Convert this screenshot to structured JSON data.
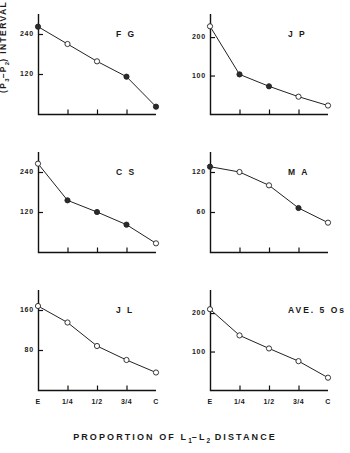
{
  "figure": {
    "ylabel_text": "INTERVAL  (MSEC)",
    "ylabel_prefix": "(P",
    "ylabel_sub1": "3",
    "ylabel_mid": "–P",
    "ylabel_sub2": "2",
    "ylabel_suffix": ")",
    "xlabel_pre": "PROPORTION   OF   L",
    "xlabel_sub1": "1",
    "xlabel_mid": "–L",
    "xlabel_sub2": "2",
    "xlabel_post": "   DISTANCE"
  },
  "chart_data": [
    {
      "type": "line",
      "title": "F G",
      "xlabel": "PROPORTION OF L1-L2 DISTANCE",
      "ylabel": "(P3-P2) INTERVAL (MSEC)",
      "categories": [
        "E",
        "1/4",
        "1/2",
        "3/4",
        "C"
      ],
      "yticks": [
        240,
        120
      ],
      "ylim": [
        0,
        300
      ],
      "values": [
        262,
        210,
        158,
        112,
        22
      ],
      "markers": [
        "filled",
        "open",
        "open",
        "filled",
        "filled"
      ],
      "grid": false,
      "legend": "none"
    },
    {
      "type": "line",
      "title": "J P",
      "xlabel": "PROPORTION OF L1-L2 DISTANCE",
      "ylabel": "(P3-P2) INTERVAL (MSEC)",
      "categories": [
        "E",
        "1/4",
        "1/2",
        "3/4",
        "C"
      ],
      "yticks": [
        200,
        100
      ],
      "ylim": [
        0,
        260
      ],
      "values": [
        228,
        103,
        72,
        45,
        22
      ],
      "markers": [
        "open",
        "filled",
        "filled",
        "open",
        "open"
      ],
      "grid": false,
      "legend": "none"
    },
    {
      "type": "line",
      "title": "C S",
      "xlabel": "PROPORTION OF L1-L2 DISTANCE",
      "ylabel": "(P3-P2) INTERVAL (MSEC)",
      "categories": [
        "E",
        "1/4",
        "1/2",
        "3/4",
        "C"
      ],
      "yticks": [
        240,
        120
      ],
      "ylim": [
        0,
        300
      ],
      "values": [
        265,
        155,
        120,
        82,
        26
      ],
      "markers": [
        "open",
        "filled",
        "filled",
        "filled",
        "open"
      ],
      "grid": false,
      "legend": "none"
    },
    {
      "type": "line",
      "title": "M A",
      "xlabel": "PROPORTION OF L1-L2 DISTANCE",
      "ylabel": "(P3-P2) INTERVAL (MSEC)",
      "categories": [
        "E",
        "1/4",
        "1/2",
        "3/4",
        "C"
      ],
      "yticks": [
        120,
        60
      ],
      "ylim": [
        0,
        150
      ],
      "values": [
        128,
        120,
        100,
        66,
        44
      ],
      "markers": [
        "filled",
        "open",
        "open",
        "filled",
        "open"
      ],
      "grid": false,
      "legend": "none"
    },
    {
      "type": "line",
      "title": "J L",
      "xlabel": "PROPORTION OF L1-L2 DISTANCE",
      "ylabel": "(P3-P2) INTERVAL (MSEC)",
      "categories": [
        "E",
        "1/4",
        "1/2",
        "3/4",
        "C"
      ],
      "yticks": [
        160,
        80
      ],
      "ylim": [
        0,
        200
      ],
      "values": [
        168,
        135,
        88,
        60,
        35
      ],
      "markers": [
        "open",
        "open",
        "open",
        "open",
        "open"
      ],
      "grid": false,
      "legend": "none"
    },
    {
      "type": "line",
      "title": "AVE. 5 Os",
      "xlabel": "PROPORTION OF L1-L2 DISTANCE",
      "ylabel": "(P3-P2) INTERVAL (MSEC)",
      "categories": [
        "E",
        "1/4",
        "1/2",
        "3/4",
        "C"
      ],
      "yticks": [
        200,
        100
      ],
      "ylim": [
        0,
        260
      ],
      "values": [
        210,
        142,
        108,
        75,
        32
      ],
      "markers": [
        "open",
        "open",
        "open",
        "open",
        "open"
      ],
      "grid": false,
      "legend": "none"
    }
  ]
}
